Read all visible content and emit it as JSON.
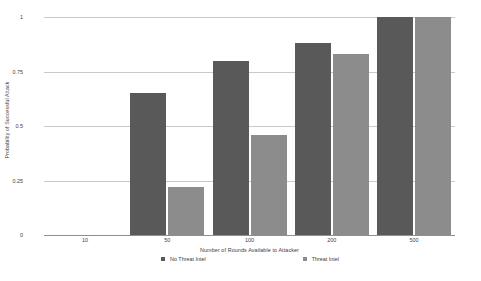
{
  "chart_data": {
    "type": "bar",
    "title": "",
    "subtitle": "",
    "xlabel": "Number of Rounds Available to Attacker",
    "ylabel": "Probability of Successful Attack",
    "categories": [
      "10",
      "50",
      "100",
      "200",
      "500"
    ],
    "series": [
      {
        "name": "No Threat Intel",
        "color": "#595959",
        "values": [
          0,
          0.65,
          0.8,
          0.88,
          1.0
        ]
      },
      {
        "name": "Threat Intel",
        "color": "#8c8c8c",
        "values": [
          0,
          0.22,
          0.46,
          0.83,
          1.0
        ]
      }
    ],
    "ylim": [
      0,
      1
    ],
    "yticks": [
      0,
      0.25,
      0.5,
      0.75,
      1
    ],
    "ytick_labels": [
      "0",
      "0.25",
      "0.5",
      "0.75",
      "1"
    ],
    "grid": true,
    "legend_position": "bottom",
    "background_color": "#ffffff",
    "gridline_color": "#c9c9c9",
    "axis_color": "#8f8f8f",
    "text_color": "#3d3d3d"
  }
}
